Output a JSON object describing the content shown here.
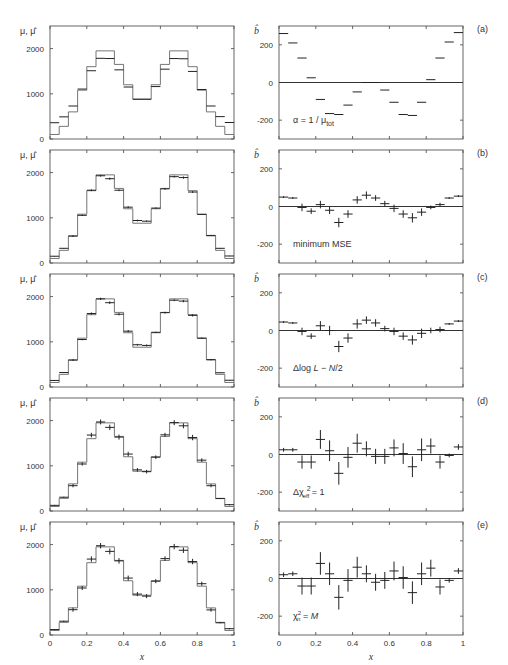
{
  "chart_data": {
    "type": "line",
    "title": "",
    "xlabel": "x",
    "x_ticks": [
      "0",
      "0.2",
      "0.4",
      "0.6",
      "0.8",
      "1"
    ],
    "bin_edges": [
      0,
      0.05,
      0.1,
      0.15,
      0.2,
      0.25,
      0.3,
      0.35,
      0.4,
      0.45,
      0.5,
      0.55,
      0.6,
      0.65,
      0.7,
      0.75,
      0.8,
      0.85,
      0.9,
      0.95,
      1.0
    ],
    "true_mu": [
      100,
      280,
      600,
      1080,
      1600,
      1950,
      1950,
      1650,
      1200,
      880,
      880,
      1200,
      1650,
      1950,
      1950,
      1600,
      1080,
      600,
      280,
      100
    ],
    "left": {
      "ylabel": "μ, μ̂",
      "ylim": [
        0,
        2500
      ],
      "y_ticks": [
        0,
        1000,
        2000
      ],
      "y_tick_labels": [
        "0",
        "1000",
        "2000"
      ]
    },
    "right": {
      "ylabel": "b̂",
      "ylim": [
        -300,
        300
      ],
      "y_ticks": [
        -200,
        0,
        200
      ],
      "y_tick_labels": [
        "-200",
        "0",
        "200"
      ]
    },
    "panels": [
      {
        "tag": "(a)",
        "annotation": "α = 1 / μtot",
        "bias": [
          260,
          210,
          130,
          25,
          -90,
          -165,
          -170,
          -120,
          -50,
          0,
          0,
          -40,
          -105,
          -170,
          -175,
          -105,
          15,
          130,
          215,
          265
        ],
        "bias_err": [
          0,
          0,
          0,
          0,
          0,
          0,
          0,
          0,
          0,
          0,
          0,
          0,
          0,
          0,
          0,
          0,
          0,
          0,
          0,
          0
        ]
      },
      {
        "tag": "(b)",
        "annotation": "minimum MSE",
        "bias": [
          50,
          45,
          -5,
          -25,
          10,
          -20,
          -85,
          -40,
          35,
          60,
          45,
          15,
          -10,
          -40,
          -60,
          -30,
          -5,
          10,
          45,
          55
        ],
        "bias_err": [
          5,
          5,
          20,
          15,
          20,
          20,
          25,
          20,
          20,
          20,
          15,
          15,
          20,
          20,
          25,
          20,
          10,
          10,
          5,
          5
        ]
      },
      {
        "tag": "(c)",
        "annotation": "Δlog L−N/2",
        "bias": [
          45,
          40,
          -5,
          -30,
          25,
          0,
          -85,
          -40,
          35,
          55,
          40,
          10,
          -5,
          -30,
          -50,
          -15,
          0,
          5,
          35,
          50
        ],
        "bias_err": [
          5,
          5,
          20,
          15,
          25,
          25,
          30,
          25,
          25,
          20,
          20,
          15,
          20,
          20,
          25,
          25,
          15,
          15,
          5,
          5
        ]
      },
      {
        "tag": "(d)",
        "annotation": "Δχ²eff = 1",
        "bias": [
          25,
          25,
          -40,
          -40,
          80,
          20,
          -100,
          -15,
          60,
          30,
          -10,
          -10,
          35,
          5,
          -65,
          25,
          45,
          -40,
          -5,
          40
        ],
        "bias_err": [
          10,
          10,
          35,
          35,
          50,
          55,
          60,
          55,
          50,
          40,
          40,
          40,
          45,
          55,
          55,
          60,
          40,
          35,
          10,
          15
        ]
      },
      {
        "tag": "(e)",
        "annotation": "χ²n = M",
        "bias": [
          20,
          25,
          -40,
          -40,
          80,
          25,
          -100,
          -10,
          60,
          25,
          -20,
          -10,
          40,
          5,
          -75,
          25,
          55,
          -45,
          -10,
          40
        ],
        "bias_err": [
          12,
          12,
          45,
          45,
          60,
          60,
          65,
          60,
          55,
          45,
          45,
          45,
          50,
          60,
          60,
          60,
          45,
          40,
          12,
          15
        ]
      }
    ]
  }
}
